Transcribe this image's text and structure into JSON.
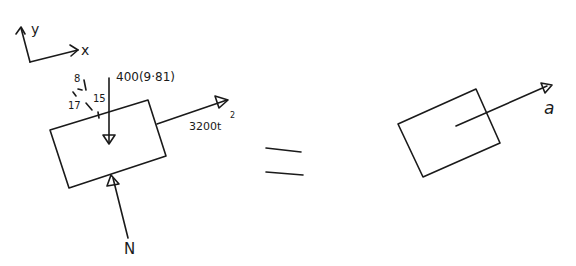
{
  "diagram": {
    "type": "free-body-diagram / kinetic-diagram",
    "axes": {
      "x_label": "x",
      "y_label": "y"
    },
    "fbd": {
      "weight_label": "400(9·81)",
      "applied_force_label": "3200t",
      "applied_force_exponent": "2",
      "normal_force_label": "N",
      "slope_triangle": {
        "rise": "8",
        "run": "15",
        "hyp": "17"
      }
    },
    "equals_sign": "=",
    "kinetic_diagram": {
      "acceleration_label": "a"
    }
  }
}
